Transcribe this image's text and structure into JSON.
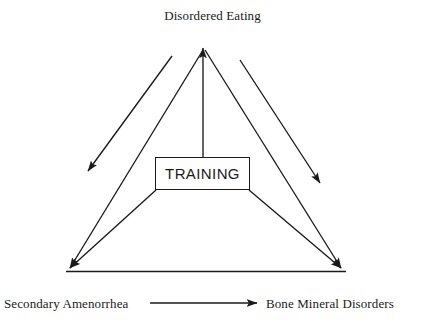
{
  "diagram": {
    "title_node": "Disordered Eating",
    "left_node": "Secondary Amenorrhea",
    "right_node": "Bone Mineral Disorders",
    "center_node": "TRAINING",
    "stroke_color": "#1a1a1a",
    "background_color": "#ffffff",
    "nodes": [
      {
        "id": "disordered-eating",
        "label": "Disordered Eating",
        "position": "apex-top"
      },
      {
        "id": "secondary-amenorrhea",
        "label": "Secondary Amenorrhea",
        "position": "bottom-left"
      },
      {
        "id": "bone-mineral-disorders",
        "label": "Bone Mineral Disorders",
        "position": "bottom-right"
      },
      {
        "id": "training",
        "label": "TRAINING",
        "position": "center-box"
      }
    ],
    "edges": [
      {
        "from": "training",
        "to": "disordered-eating",
        "arrow": "end"
      },
      {
        "from": "training",
        "to": "secondary-amenorrhea",
        "arrow": "end"
      },
      {
        "from": "training",
        "to": "bone-mineral-disorders",
        "arrow": "end"
      },
      {
        "from": "disordered-eating",
        "to": "secondary-amenorrhea",
        "arrow": "end"
      },
      {
        "from": "disordered-eating",
        "to": "bone-mineral-disorders",
        "arrow": "end"
      },
      {
        "from": "disordered-eating-inner-left",
        "to": "left-midpoint",
        "arrow": "end"
      },
      {
        "from": "disordered-eating-inner-right",
        "to": "right-midpoint",
        "arrow": "end"
      },
      {
        "from": "secondary-amenorrhea",
        "to": "bone-mineral-disorders",
        "arrow": "end"
      }
    ]
  }
}
